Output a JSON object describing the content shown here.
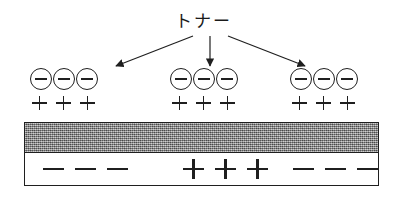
{
  "figure": {
    "title_label": "トナー",
    "background_color": "#ffffff",
    "ink_color": "#1f1f1f"
  },
  "arrows": [
    {
      "name": "arrow-to-left-group",
      "from_x": 193,
      "from_y": 36,
      "to_x": 116,
      "to_y": 66
    },
    {
      "name": "arrow-to-middle-group",
      "from_x": 210,
      "from_y": 36,
      "to_x": 210,
      "to_y": 66
    },
    {
      "name": "arrow-to-right-group",
      "from_x": 228,
      "from_y": 36,
      "to_x": 305,
      "to_y": 66
    }
  ],
  "toner_groups": [
    {
      "name": "left",
      "negative_particles": [
        "−",
        "−",
        "−"
      ],
      "surface_charges": [
        "+",
        "+",
        "+"
      ]
    },
    {
      "name": "middle",
      "negative_particles": [
        "−",
        "−",
        "−"
      ],
      "surface_charges": [
        "+",
        "+",
        "+"
      ]
    },
    {
      "name": "right",
      "negative_particles": [
        "−",
        "−",
        "−"
      ],
      "surface_charges": [
        "+",
        "+",
        "+"
      ]
    }
  ],
  "substrate": {
    "charge_layer": {
      "name": "gray-charged-layer",
      "fill": "#8c8c8c",
      "texture": "dithered-gray"
    },
    "base_layer": {
      "name": "white-base-layer",
      "fill": "#ffffff",
      "sign_groups": [
        {
          "name": "left",
          "signs": [
            "−",
            "−",
            "−"
          ]
        },
        {
          "name": "middle",
          "signs": [
            "+",
            "+",
            "+"
          ]
        },
        {
          "name": "right",
          "signs": [
            "−",
            "−",
            "−"
          ]
        }
      ]
    }
  }
}
